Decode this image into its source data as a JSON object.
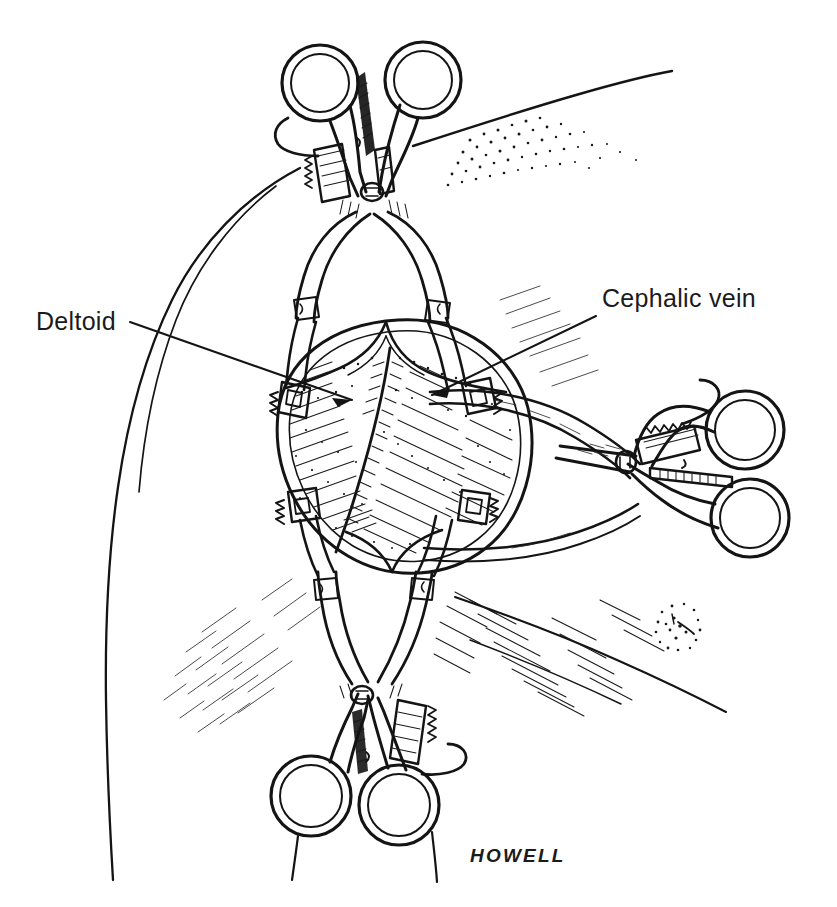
{
  "figure": {
    "kind": "medical-line-illustration",
    "background_color": "#ffffff",
    "ink_color": "#141414",
    "width": 837,
    "height": 907
  },
  "labels": [
    {
      "id": "deltoid",
      "text": "Deltoid",
      "x": 36,
      "y": 330,
      "anchor": "start",
      "leader": {
        "x1": 130,
        "y1": 322,
        "x2": 352,
        "y2": 400
      }
    },
    {
      "id": "cephalic-vein",
      "text": "Cephalic vein",
      "x": 602,
      "y": 307,
      "anchor": "start",
      "leader": {
        "x1": 596,
        "y1": 316,
        "x2": 432,
        "y2": 395
      }
    }
  ],
  "signature": {
    "text": "HOWELL",
    "x": 470,
    "y": 862
  },
  "instruments": [
    {
      "id": "retractor-superior",
      "name": "self-retaining-retractor-superior",
      "orientation": "vertical-top",
      "ring_centers": [
        [
          320,
          83
        ],
        [
          423,
          80
        ]
      ],
      "ring_outer_r": 38,
      "ring_inner_r": 29,
      "hinge": [
        372,
        190
      ],
      "has_ratchet": true
    },
    {
      "id": "retractor-inferior",
      "name": "self-retaining-retractor-inferior",
      "orientation": "vertical-bottom",
      "ring_centers": [
        [
          311,
          796
        ],
        [
          399,
          805
        ]
      ],
      "ring_outer_r": 40,
      "ring_inner_r": 31,
      "hinge": [
        362,
        695
      ],
      "has_ratchet": true
    },
    {
      "id": "retractor-lateral",
      "name": "self-retaining-retractor-lateral",
      "orientation": "horizontal-right",
      "ring_centers": [
        [
          745,
          430
        ],
        [
          750,
          518
        ]
      ],
      "ring_outer_r": 39,
      "ring_inner_r": 30,
      "hinge": [
        626,
        462
      ],
      "has_ratchet": true
    }
  ],
  "anatomy": {
    "wound_center": [
      400,
      430
    ],
    "wound_label": "retracted deltopectoral wound",
    "vessel": "cephalic vein",
    "muscle": "deltoid",
    "skin_mark": {
      "x": 678,
      "y": 625,
      "r": 22,
      "name": "stippled-skin-mark"
    }
  }
}
